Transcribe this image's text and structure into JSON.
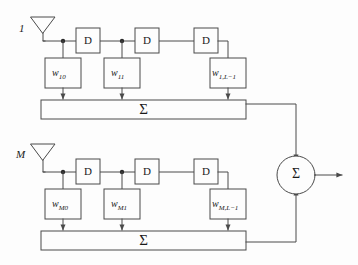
{
  "diagram": {
    "stroke_color": "#4a4a4a",
    "text_color": "#1a1a1a",
    "background": "#fdfdfd",
    "sigma_symbol": "Σ",
    "branches": [
      {
        "antenna_label": "1",
        "antenna_name": "antenna-1",
        "delays": [
          {
            "label": "D"
          },
          {
            "label": "D"
          },
          {
            "label": "D"
          }
        ],
        "weights": [
          {
            "base": "w",
            "sub": "10"
          },
          {
            "base": "w",
            "sub": "11"
          },
          {
            "base": "w",
            "sub": "1,L−1"
          }
        ],
        "summer_label": "Σ"
      },
      {
        "antenna_label": "M",
        "antenna_name": "antenna-m",
        "delays": [
          {
            "label": "D"
          },
          {
            "label": "D"
          },
          {
            "label": "D"
          }
        ],
        "weights": [
          {
            "base": "w",
            "sub": "M0"
          },
          {
            "base": "w",
            "sub": "M1"
          },
          {
            "base": "w",
            "sub": "M,L−1"
          }
        ],
        "summer_label": "Σ"
      }
    ],
    "output_combiner": {
      "label": "Σ",
      "name": "output-summing-junction"
    }
  }
}
